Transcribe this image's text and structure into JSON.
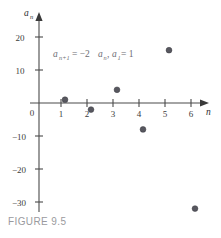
{
  "figure": {
    "caption": "FIGURE 9.5",
    "caption_color": "#9a9a9e"
  },
  "annotation": {
    "formula_plain": "a(n+1) = -2a(n), a(1) = 1",
    "base1": "a",
    "sub1": "n+1",
    "eq1": " = −2",
    "base2": "a",
    "sub2": "n",
    "comma": ", ",
    "base3": "a",
    "sub3": "1",
    "eq2": " = 1",
    "color": "#6d6d72"
  },
  "chart_data": {
    "type": "scatter",
    "title": "",
    "xlabel": "n",
    "ylabel": "a_n",
    "x": [
      1,
      2,
      3,
      4,
      5,
      6
    ],
    "values": [
      1,
      -2,
      4,
      -8,
      16,
      -32
    ],
    "series": [
      {
        "name": "a_n",
        "values": [
          1,
          -2,
          4,
          -8,
          16,
          -32
        ]
      }
    ],
    "xlim": [
      0,
      6.6
    ],
    "ylim": [
      -34,
      24
    ],
    "xticks": [
      1,
      2,
      3,
      4,
      5,
      6
    ],
    "xtick_labels": [
      "1",
      "2",
      "3",
      "4",
      "5",
      "6"
    ],
    "yticks": [
      20,
      10,
      -10,
      -20,
      -30
    ],
    "ytick_labels": [
      "20",
      "10",
      "−10",
      "−20",
      "−30"
    ],
    "origin_label": "0",
    "grid": false,
    "legend": false,
    "marker_color": "#57575f",
    "axis_color": "#4a4a4a",
    "annotation_text": "a_{n+1} = −2a_n, a_1 = 1"
  }
}
